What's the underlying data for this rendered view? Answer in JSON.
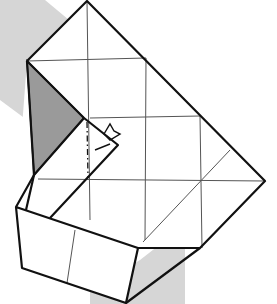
{
  "diagram": {
    "type": "origami-folding-step",
    "colors": {
      "background": "#ffffff",
      "backdrop_band": "#d6d6d6",
      "shaded_flap": "#9a9a9a",
      "outline": "#111111",
      "crease": "#555555"
    },
    "annotations": {
      "mountain_fold_line": "dash-dot vertical line in center flap",
      "fold_arrow": "small folding arrow at center-right of flap"
    }
  }
}
